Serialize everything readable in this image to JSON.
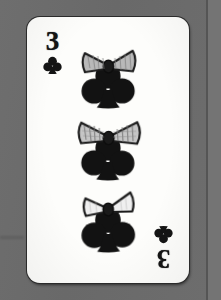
{
  "scene": {
    "description": "Scanned playing card on gray backdrop",
    "background_color": "#6c6c6c",
    "seam_color": "#4e4e4e"
  },
  "card": {
    "name": "Three of Clubs",
    "rank": "3",
    "suit": "clubs",
    "suit_symbol": "♣",
    "suit_color": "#141414",
    "face_color": "#fdfdfb",
    "border_color": "#2b2b2b",
    "pip_count": 3,
    "pip_decoration": "bow-ribbon",
    "indices": [
      {
        "position": "top-left",
        "rank": "3",
        "suit_symbol": "♣",
        "rotated": false
      },
      {
        "position": "bottom-right",
        "rank": "3",
        "suit_symbol": "♣",
        "rotated": true
      }
    ],
    "pips": [
      {
        "index": 1,
        "suit_symbol": "♣",
        "bow_color": "#b9b9b9"
      },
      {
        "index": 2,
        "suit_symbol": "♣",
        "bow_color": "#c6c6c6"
      },
      {
        "index": 3,
        "suit_symbol": "♣",
        "bow_color": "#efefef"
      }
    ]
  }
}
